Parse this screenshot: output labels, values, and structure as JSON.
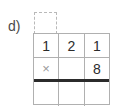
{
  "exercise": {
    "label": "d)",
    "carry_box": {
      "value": "",
      "style": "dashed",
      "border_color": "#b9b9b9"
    },
    "grid": {
      "columns": 3,
      "rows": 3,
      "border_color": "#b0b0b0",
      "answer_rule_color": "#2b2b2b",
      "rows_data": [
        {
          "name": "multiplicand-row",
          "cells": [
            "1",
            "2",
            "1"
          ]
        },
        {
          "name": "multiplier-row",
          "cells": [
            "×",
            "",
            "8"
          ]
        },
        {
          "name": "answer-row",
          "cells": [
            "",
            "",
            ""
          ]
        }
      ]
    },
    "operator_symbol": "×",
    "multiplicand": "121",
    "multiplier": "8"
  }
}
